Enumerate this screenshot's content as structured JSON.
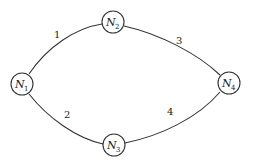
{
  "diagram": {
    "nodes": [
      {
        "id": "N1",
        "symbol": "N",
        "subscript": "1"
      },
      {
        "id": "N2",
        "symbol": "N",
        "subscript": "2"
      },
      {
        "id": "N3",
        "symbol": "N",
        "subscript": "3"
      },
      {
        "id": "N4",
        "symbol": "N",
        "subscript": "4"
      }
    ],
    "edges": [
      {
        "from": "N1",
        "to": "N2",
        "label": "1"
      },
      {
        "from": "N1",
        "to": "N3",
        "label": "2"
      },
      {
        "from": "N2",
        "to": "N4",
        "label": "3"
      },
      {
        "from": "N3",
        "to": "N4",
        "label": "4"
      }
    ]
  }
}
